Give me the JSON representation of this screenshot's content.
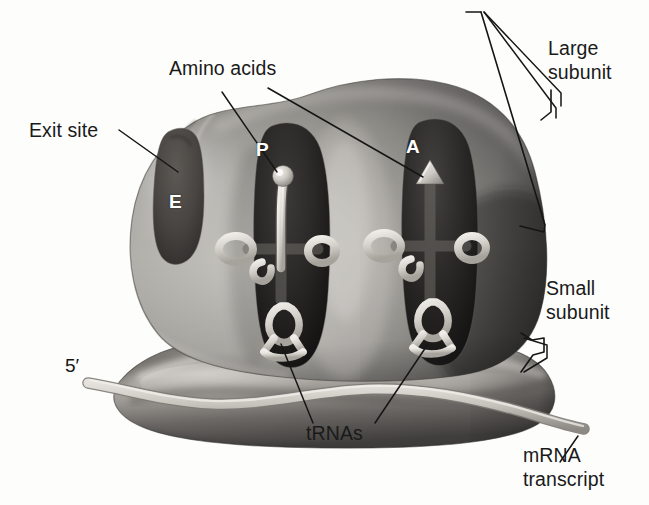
{
  "figure": {
    "background_color": "#fdfdfc",
    "ink_color": "#1a1a1a",
    "style": "grayscale airbrush biology textbook illustration"
  },
  "labels": {
    "amino_acids": "Amino acids",
    "exit_site": "Exit site",
    "large_subunit_line1": "Large",
    "large_subunit_line2": "subunit",
    "small_subunit_line1": "Small",
    "small_subunit_line2": "subunit",
    "mrna_line1": "mRNA",
    "mrna_line2": "transcript",
    "trnas": "tRNAs",
    "five_prime": "5′"
  },
  "sites": {
    "e_site": "E",
    "p_site": "P",
    "a_site": "A"
  },
  "structures": [
    {
      "name": "large-subunit",
      "description": "Large dome-shaped ribosomal subunit, upper body"
    },
    {
      "name": "small-subunit",
      "description": "Small elongated ribosomal subunit, lower body"
    },
    {
      "name": "exit-site-groove",
      "description": "U-shaped groove on the left of the large subunit"
    },
    {
      "name": "p-site-pocket",
      "description": "Dark elongated pocket holding the P-site tRNA"
    },
    {
      "name": "a-site-pocket",
      "description": "Dark elongated pocket holding the A-site tRNA"
    },
    {
      "name": "trna-p",
      "description": "Cloverleaf tRNA in the P site carrying an amino acid sphere"
    },
    {
      "name": "trna-a",
      "description": "Cloverleaf tRNA in the A site capped by a triangular amino acid"
    },
    {
      "name": "mrna-strand",
      "description": "mRNA transcript threading through the small subunit, 5 prime on the left"
    }
  ],
  "colors": {
    "subunit_light": "#b9b7b2",
    "subunit_mid": "#8e8c88",
    "subunit_dark": "#4a4845",
    "pocket_dark": "#2a2927",
    "trna_light": "#d8d6d0",
    "mrna_light": "#cfccc6",
    "leader_line": "#151515"
  }
}
